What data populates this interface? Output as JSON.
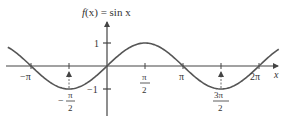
{
  "chart_data": {
    "type": "line",
    "title": "f(x) = sin x",
    "title_parts": {
      "f": "f",
      "x": "x",
      "eq": " = sin ",
      "var": "x"
    },
    "xlabel": "x",
    "ylabel": "",
    "xlim": [
      -4.3,
      7.6
    ],
    "ylim": [
      -1.5,
      1.5
    ],
    "grid": false,
    "legend": null,
    "x_ticks": [
      {
        "value": -3.14159,
        "label": "−π",
        "pos": "below"
      },
      {
        "value": -1.5708,
        "label_num": "π",
        "label_den": "2",
        "sign": "−",
        "pos": "below"
      },
      {
        "value": 1.5708,
        "label_num": "π",
        "label_den": "2",
        "sign": "",
        "pos": "below"
      },
      {
        "value": 3.14159,
        "label": "π",
        "pos": "below"
      },
      {
        "value": 4.7124,
        "label_num": "3π",
        "label_den": "2",
        "sign": "",
        "pos": "below"
      },
      {
        "value": 6.28318,
        "label": "2π",
        "pos": "below"
      }
    ],
    "y_ticks": [
      {
        "value": 1,
        "label": "1"
      },
      {
        "value": -1,
        "label": "−1"
      }
    ],
    "series": [
      {
        "name": "sin x",
        "color": "#555555",
        "x": [
          -4.1,
          -3.14159,
          -2.356,
          -1.5708,
          -0.785,
          0,
          0.785,
          1.5708,
          2.356,
          3.14159,
          3.927,
          4.7124,
          5.498,
          6.28318,
          7.1
        ],
        "values": [
          0.818,
          0,
          -0.707,
          -1,
          -0.707,
          0,
          0.707,
          1,
          0.707,
          0,
          -0.707,
          -1,
          -0.707,
          0,
          0.737
        ]
      }
    ],
    "annotations": [
      {
        "type": "arrow",
        "x": -1.5708,
        "from": -1,
        "to": 0,
        "label": "dashed guide up to min"
      },
      {
        "type": "arrow",
        "x": 4.7124,
        "from": -1,
        "to": 0,
        "label": "dashed guide up to min"
      }
    ]
  },
  "labels": {
    "title_f": "f",
    "title_paren": "(x) = sin x",
    "x_axis": "x",
    "y1": "1",
    "ym1": "−1",
    "neg_pi": "−π",
    "pi": "π",
    "two_pi": "2π",
    "pi_num": "π",
    "two": "2",
    "three_pi": "3π",
    "minus": "−"
  },
  "colors": {
    "axis": "#444444",
    "curve": "#555555",
    "text": "#333333"
  }
}
